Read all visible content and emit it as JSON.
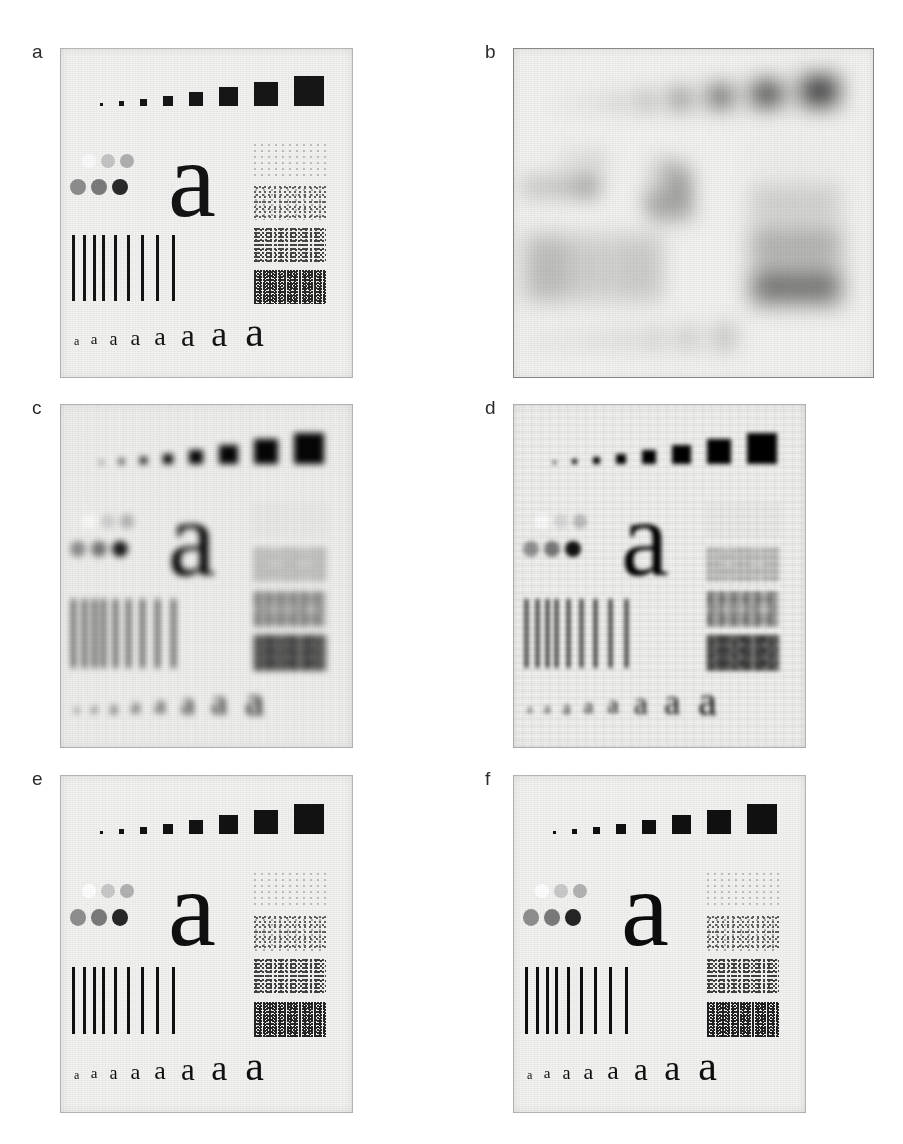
{
  "figure": {
    "caption": "",
    "background_color": "#ffffff",
    "panel_background": "#f2f2f0",
    "ink_color": "#161616",
    "label_color": "#2b2b2b"
  },
  "panels": [
    {
      "id": "a",
      "label": "a",
      "description": "original resolution test chart",
      "effect": "fx-original",
      "x": 60,
      "y": 48,
      "w": 293,
      "h": 330
    },
    {
      "id": "b",
      "label": "b",
      "description": "blurred / degraded observation",
      "effect": "fx-blurred",
      "x": 513,
      "y": 48,
      "w": 361,
      "h": 330
    },
    {
      "id": "c",
      "label": "c",
      "description": "restoration result, heavy residual blur",
      "effect": "fx-restored-a",
      "x": 60,
      "y": 404,
      "w": 293,
      "h": 344
    },
    {
      "id": "d",
      "label": "d",
      "description": "restoration result with ringing artifacts",
      "effect": "fx-restored-b",
      "x": 513,
      "y": 404,
      "w": 293,
      "h": 344
    },
    {
      "id": "e",
      "label": "e",
      "description": "restoration result, near original quality",
      "effect": "fx-restored-c",
      "x": 60,
      "y": 775,
      "w": 293,
      "h": 338
    },
    {
      "id": "f",
      "label": "f",
      "description": "restoration result, near original quality",
      "effect": "fx-restored-d",
      "x": 513,
      "y": 775,
      "w": 293,
      "h": 338
    }
  ],
  "chart_data": {
    "type": "table",
    "squares": {
      "name": "square-size-ramp",
      "count": 8,
      "sizes_px": [
        3,
        5,
        7,
        10,
        14,
        19,
        24,
        30
      ],
      "fill": "#161616",
      "row_y_fraction": 0.12
    },
    "dots": {
      "name": "grayscale-dot-ramp",
      "top_row": [
        {
          "value": 0.04,
          "color": "#fbfbfb"
        },
        {
          "value": 0.22,
          "color": "#c6c6c6"
        },
        {
          "value": 0.34,
          "color": "#b0b0b0"
        }
      ],
      "bottom_row": [
        {
          "value": 0.52,
          "color": "#8e8e8e"
        },
        {
          "value": 0.64,
          "color": "#7b7b7b"
        },
        {
          "value": 0.88,
          "color": "#2a2a2a"
        }
      ],
      "diameter_px": 14
    },
    "big_letter": {
      "name": "large-a-glyph",
      "text": "a",
      "font_px": 108
    },
    "bars": {
      "name": "vertical-bar-target",
      "count": 9,
      "widths_px": [
        3,
        3,
        3,
        3,
        3,
        3,
        3,
        3,
        3
      ],
      "gaps_px": [
        8,
        7,
        6,
        9,
        10,
        11,
        12,
        13
      ],
      "height_px": 66,
      "fill": "#141414"
    },
    "noise_patches": {
      "name": "texture-density-ramp",
      "count": 4,
      "densities": [
        0.18,
        0.34,
        0.55,
        0.78
      ],
      "patch_w_px": 72,
      "patch_h_px": 34
    },
    "letter_row": {
      "name": "letter-size-ramp",
      "text": "a",
      "count": 8,
      "font_sizes_px": [
        12,
        15,
        18,
        22,
        26,
        31,
        36,
        42
      ]
    }
  }
}
